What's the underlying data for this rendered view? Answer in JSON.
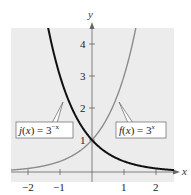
{
  "chart_data": {
    "type": "line",
    "title": "",
    "xlabel": "x",
    "ylabel": "y",
    "xlim": [
      -2.5,
      2.6
    ],
    "ylim": [
      0,
      4.6
    ],
    "x_ticks": [
      -2,
      -1,
      1,
      2
    ],
    "y_ticks": [
      1,
      2,
      3,
      4
    ],
    "grid": false,
    "series": [
      {
        "name": "f(x) = 3^x",
        "label_main": "f(x) = 3",
        "label_exp": "x",
        "color": "#8c8c8c",
        "expression": "3^x",
        "x": [
          -2.5,
          -2,
          -1,
          0,
          1,
          1.37
        ],
        "values": [
          0.064,
          0.111,
          0.333,
          1,
          3,
          4.5
        ]
      },
      {
        "name": "j(x) = 3^-x",
        "label_main": "j(x) = 3",
        "label_exp": "−x",
        "color": "#111111",
        "expression": "3^-x",
        "x": [
          -1.37,
          -1,
          0,
          1,
          2,
          2.5
        ],
        "values": [
          4.5,
          3,
          1,
          0.333,
          0.111,
          0.064
        ]
      }
    ],
    "colors": {
      "plot_background": "#ececec",
      "axis": "#666666"
    }
  },
  "labels": {
    "x_axis": "x",
    "y_axis": "y",
    "x_ticks": [
      "−2",
      "−1",
      "1",
      "2"
    ],
    "y_ticks": [
      "1",
      "2",
      "3",
      "4"
    ],
    "j_label_main": "j(x) = 3",
    "j_label_exp": "−x",
    "f_label_main": "f(x) = 3",
    "f_label_exp": "x"
  }
}
